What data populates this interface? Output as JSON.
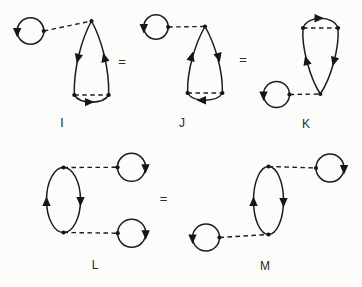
{
  "figure": {
    "type": "feynman-diagram-identities",
    "paper_color": "#fcfcfb",
    "ink_color": "#1c1c1c",
    "equals": "=",
    "relations": [
      "I = J = K",
      "L = M"
    ],
    "diagrams": {
      "I": {
        "label": "I",
        "components": [
          "fermion-bubble-counterclockwise",
          "dashed-interaction-line",
          "teardrop-loop-apex-top",
          "dashed-chord-bottom",
          "bottom-arc-arrow-right"
        ],
        "loop_direction": "counterclockwise"
      },
      "J": {
        "label": "J",
        "components": [
          "fermion-bubble-counterclockwise",
          "dashed-interaction-line",
          "teardrop-loop-apex-top",
          "dashed-chord-bottom",
          "bottom-arc-arrow-left"
        ],
        "loop_direction": "clockwise"
      },
      "K": {
        "label": "K",
        "components": [
          "teardrop-loop-apex-bottom",
          "dashed-chord-top",
          "top-arc-arrow-right",
          "dashed-interaction-line",
          "fermion-bubble-counterclockwise"
        ],
        "loop_direction": "clockwise"
      },
      "L": {
        "label": "L",
        "components": [
          "vertical-lens-loop",
          "dashed-interaction-line-top",
          "fermion-bubble-clockwise-top-right",
          "dashed-interaction-line-bottom",
          "fermion-bubble-clockwise-bottom-right"
        ],
        "loop_direction": "left-up-right-down"
      },
      "M": {
        "label": "M",
        "components": [
          "fermion-bubble-counterclockwise-bottom-left",
          "dashed-interaction-line-bottom",
          "vertical-lens-loop",
          "dashed-interaction-line-top",
          "fermion-bubble-clockwise-top-right"
        ],
        "loop_direction": "left-up-right-down"
      }
    }
  }
}
